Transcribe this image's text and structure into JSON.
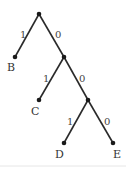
{
  "diagram": {
    "type": "binary-code-tree",
    "nodes": [
      {
        "id": "root",
        "x": 39,
        "y": 14,
        "label": ""
      },
      {
        "id": "n1",
        "x": 64,
        "y": 57,
        "label": ""
      },
      {
        "id": "n2",
        "x": 88,
        "y": 100,
        "label": ""
      },
      {
        "id": "B",
        "x": 15,
        "y": 57,
        "label": "B"
      },
      {
        "id": "C",
        "x": 39,
        "y": 100,
        "label": "C"
      },
      {
        "id": "D",
        "x": 64,
        "y": 143,
        "label": "D"
      },
      {
        "id": "E",
        "x": 113,
        "y": 143,
        "label": "E"
      }
    ],
    "edges": [
      {
        "from": "root",
        "to": "B",
        "label": "1"
      },
      {
        "from": "root",
        "to": "n1",
        "label": "0"
      },
      {
        "from": "n1",
        "to": "C",
        "label": "1"
      },
      {
        "from": "n1",
        "to": "n2",
        "label": "0"
      },
      {
        "from": "n2",
        "to": "D",
        "label": "1"
      },
      {
        "from": "n2",
        "to": "E",
        "label": "0"
      }
    ],
    "leaf_labels": {
      "B": "B",
      "C": "C",
      "D": "D",
      "E": "E"
    },
    "edge_labels": {
      "root_B": "1",
      "root_n1": "0",
      "n1_C": "1",
      "n1_n2": "0",
      "n2_D": "1",
      "n2_E": "0"
    }
  }
}
